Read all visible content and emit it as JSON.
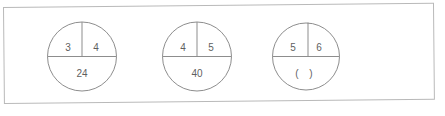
{
  "page": {
    "background_color": "#ffffff",
    "frame_color": "#b9b9b9",
    "ink_color": "#5f5f5f",
    "stroke_color": "#8d8d8d"
  },
  "worksheet": {
    "problems": [
      {
        "id": "problem-1",
        "left_factor": "3",
        "right_factor": "4",
        "product": "24",
        "product_is_blank": false
      },
      {
        "id": "problem-2",
        "left_factor": "4",
        "right_factor": "5",
        "product": "40",
        "product_is_blank": false
      },
      {
        "id": "problem-3",
        "left_factor": "5",
        "right_factor": "6",
        "product": "( )",
        "product_is_blank": true
      }
    ]
  }
}
